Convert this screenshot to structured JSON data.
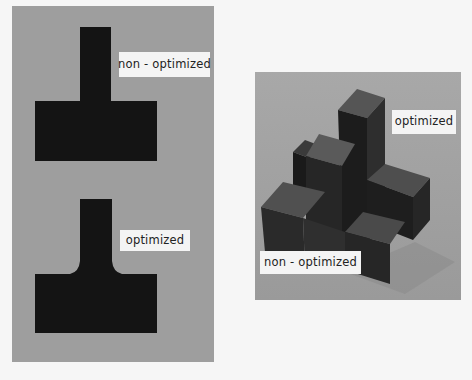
{
  "figure": {
    "left_panel": {
      "top": {
        "shape": "T-shaped cross-section",
        "label": "non - optimized"
      },
      "bottom": {
        "shape": "T-shaped cross-section with fillets",
        "label": "optimized"
      }
    },
    "right_panel": {
      "shape": "3D block assembly photo",
      "labels": {
        "optimized": "optimized",
        "non_optimized": "non - optimized"
      }
    }
  },
  "colors": {
    "panel_bg": "#9e9e9e",
    "shape_fill": "#141414",
    "label_bg": "#f4f4f4"
  }
}
